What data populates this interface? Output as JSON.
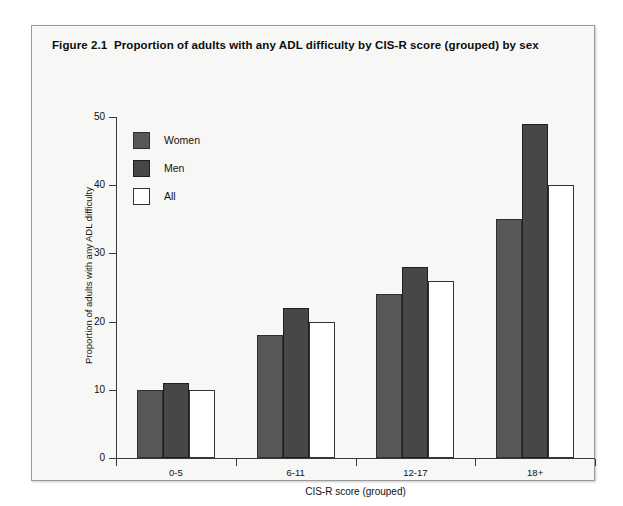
{
  "figure": {
    "number": "Figure 2.1",
    "caption": "Proportion of adults with any ADL difficulty by CIS-R score (grouped) by sex"
  },
  "colors": {
    "women": "#585858",
    "men": "#474747",
    "all": "#ffffff",
    "axis": "#3a3a3a",
    "panel_background": "#f7f7f5",
    "frame_border": "#9a9a9a"
  },
  "legend": {
    "position": "top-left-inside",
    "items": [
      {
        "label": "Women",
        "key": "women",
        "swatch": "#585858"
      },
      {
        "label": "Men",
        "key": "men",
        "swatch": "#474747"
      },
      {
        "label": "All",
        "key": "all",
        "swatch": "#ffffff"
      }
    ]
  },
  "chart_data": {
    "type": "bar",
    "title": "Figure 2.1  Proportion of adults with any ADL difficulty by CIS-R score (grouped) by sex",
    "xlabel": "CIS-R score (grouped)",
    "ylabel": "Proportion of adults with any ADL difficulty",
    "categories": [
      "0-5",
      "6-11",
      "12-17",
      "18+"
    ],
    "series": [
      {
        "name": "Women",
        "values": [
          10,
          18,
          24,
          35
        ]
      },
      {
        "name": "Men",
        "values": [
          11,
          22,
          28,
          49
        ]
      },
      {
        "name": "All",
        "values": [
          10,
          20,
          26,
          40
        ]
      }
    ],
    "ylim": [
      0,
      50
    ],
    "yticks": [
      0,
      10,
      20,
      30,
      40,
      50
    ],
    "ytick_labels": [
      "0",
      "10",
      "20",
      "30",
      "40",
      "50"
    ],
    "grid": false,
    "legend_position": "upper left"
  }
}
